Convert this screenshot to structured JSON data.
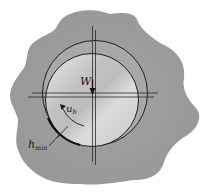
{
  "diagram": {
    "labels": {
      "load": "W",
      "velocity": "u",
      "velocity_sub": "b",
      "min_film": "h",
      "min_film_sub": "min"
    },
    "colors": {
      "background": "#ffffff",
      "housing": "#9c9c9c",
      "journal_light": "#e6e6e6",
      "journal_dark": "#b4b4b4",
      "line": "#1e1e1e"
    }
  }
}
